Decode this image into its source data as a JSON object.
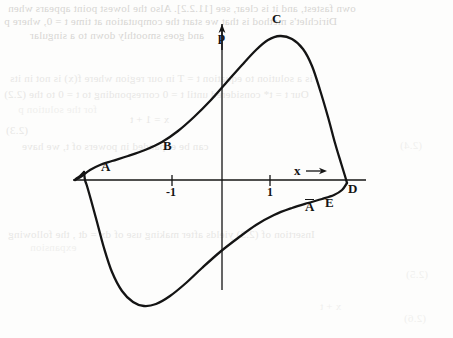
{
  "document": {
    "kind": "scanned-textbook-figure-page",
    "page_width": 453,
    "page_height": 338,
    "background_color": "#fdfdfc",
    "ink_color": "#141414",
    "bleed_color": "#b9b7b3"
  },
  "figure": {
    "caption": "",
    "axes": {
      "vertical": {
        "name": "p",
        "label": "p",
        "arrow": "up",
        "x_px": 222,
        "top_px": 22,
        "bottom_px": 290
      },
      "horizontal": {
        "name": "x",
        "label": "x",
        "arrow": "right",
        "arrow_label": "x→",
        "y_px": 180,
        "left_px": 73,
        "right_px": 366
      },
      "ticks": [
        {
          "label": "-1",
          "value": -1,
          "x_px": 172
        },
        {
          "label": "1",
          "value": 1,
          "x_px": 270
        }
      ],
      "unit_px": 49
    },
    "point_labels": [
      {
        "id": "A",
        "label": "A",
        "x_px": 101,
        "y_px": 160,
        "overbar": false
      },
      {
        "id": "B",
        "label": "B",
        "x_px": 163,
        "y_px": 139,
        "overbar": false
      },
      {
        "id": "C",
        "label": "C",
        "x_px": 272,
        "y_px": 12,
        "overbar": false
      },
      {
        "id": "D",
        "label": "D",
        "x_px": 348,
        "y_px": 182,
        "overbar": false
      },
      {
        "id": "E",
        "label": "E",
        "x_px": 325,
        "y_px": 196,
        "overbar": false
      },
      {
        "id": "Abar",
        "label": "A",
        "x_px": 305,
        "y_px": 199,
        "overbar": true
      }
    ]
  },
  "chart_data": {
    "type": "line",
    "title": "",
    "xlabel": "x",
    "ylabel": "p",
    "grid": false,
    "legend": "none",
    "xlim": [
      -3.05,
      2.95
    ],
    "ylim": [
      -2.55,
      3.25
    ],
    "xticks": [
      -1,
      1
    ],
    "yticks": [],
    "series": [
      {
        "name": "upper-branch",
        "comment": "Path running from the left turning point through A and B up to the maximum C and steeply down to D on the x-axis.",
        "points_px": [
          [
            75,
            180
          ],
          [
            82,
            176
          ],
          [
            90,
            170
          ],
          [
            100,
            165
          ],
          [
            112,
            161
          ],
          [
            128,
            156
          ],
          [
            145,
            150
          ],
          [
            162,
            142
          ],
          [
            178,
            131
          ],
          [
            194,
            117
          ],
          [
            210,
            101
          ],
          [
            226,
            83
          ],
          [
            242,
            65
          ],
          [
            256,
            50
          ],
          [
            268,
            40
          ],
          [
            280,
            36
          ],
          [
            292,
            39
          ],
          [
            303,
            49
          ],
          [
            312,
            66
          ],
          [
            320,
            90
          ],
          [
            328,
            117
          ],
          [
            335,
            143
          ],
          [
            341,
            163
          ],
          [
            345,
            176
          ],
          [
            347,
            183
          ]
        ]
      },
      {
        "name": "lower-branch",
        "comment": "Path continuing from D back leftwards below the axis through E and A-bar, down to the minimum and steeply up to close at the left turning point.",
        "points_px": [
          [
            347,
            183
          ],
          [
            342,
            190
          ],
          [
            334,
            195
          ],
          [
            322,
            199
          ],
          [
            308,
            203
          ],
          [
            292,
            208
          ],
          [
            274,
            215
          ],
          [
            256,
            225
          ],
          [
            238,
            238
          ],
          [
            220,
            252
          ],
          [
            202,
            268
          ],
          [
            186,
            283
          ],
          [
            170,
            296
          ],
          [
            156,
            304
          ],
          [
            144,
            306
          ],
          [
            133,
            302
          ],
          [
            122,
            291
          ],
          [
            112,
            272
          ],
          [
            104,
            248
          ],
          [
            97,
            222
          ],
          [
            91,
            200
          ],
          [
            87,
            186
          ],
          [
            85,
            180
          ],
          [
            84,
            172
          ]
        ]
      },
      {
        "name": "left-cusp",
        "comment": "Short steep left turning segment joining the two branches just left of the origin.",
        "points_px": [
          [
            84,
            172
          ],
          [
            80,
            176
          ],
          [
            76,
            179
          ],
          [
            75,
            180
          ]
        ]
      }
    ]
  },
  "bleed_text": {
    "note": "Faint mirrored show-through of printed text from the reverse side of the page.",
    "lines": [
      {
        "text": "own fastest, and it is clear, see [11.2.2].  Also the lowest point appears when",
        "x_px": 8,
        "y_px": 2,
        "size_px": 11,
        "class": "bleed"
      },
      {
        "text": "Dirichlet's method is that we start the computation at time t = 0, where p",
        "x_px": 4,
        "y_px": 15,
        "size_px": 11,
        "class": "bleed"
      },
      {
        "text": "and goes smoothly down to a singular",
        "x_px": 30,
        "y_px": 29,
        "size_px": 11,
        "class": "bleed"
      },
      {
        "text": "is a solution to equation   t = T   in our region where f(x) is not in its",
        "x_px": 10,
        "y_px": 72,
        "size_px": 11,
        "class": "bleed faint"
      },
      {
        "text": "Our  t = t* considered until   t = 0 corresponding to   t = 0 to the  (2.2)",
        "x_px": 4,
        "y_px": 88,
        "size_px": 11,
        "class": "bleed faint"
      },
      {
        "text": "for the solution p",
        "x_px": 18,
        "y_px": 103,
        "size_px": 11,
        "class": "bleed veryfaint"
      },
      {
        "text": "x = 1 + t",
        "x_px": 130,
        "y_px": 113,
        "size_px": 11,
        "class": "bleed faint"
      },
      {
        "text": "(2.3)",
        "x_px": 6,
        "y_px": 124,
        "size_px": 11,
        "class": "bleed faint"
      },
      {
        "text": "can be expanded in powers of  t, we have",
        "x_px": 22,
        "y_px": 140,
        "size_px": 11,
        "class": "bleed faint"
      },
      {
        "text": "(2.4)",
        "x_px": 400,
        "y_px": 139,
        "size_px": 11,
        "class": "bleed veryfaint"
      },
      {
        "text": "Insertion of (2.3) yields after making use of  dx = dt , the following",
        "x_px": 8,
        "y_px": 228,
        "size_px": 11,
        "class": "bleed faint"
      },
      {
        "text": "expansion",
        "x_px": 30,
        "y_px": 241,
        "size_px": 11,
        "class": "bleed veryfaint"
      },
      {
        "text": "(2.5)",
        "x_px": 406,
        "y_px": 268,
        "size_px": 11,
        "class": "bleed veryfaint"
      },
      {
        "text": "(2.6)",
        "x_px": 404,
        "y_px": 312,
        "size_px": 11,
        "class": "bleed veryfaint"
      },
      {
        "text": "x + t",
        "x_px": 320,
        "y_px": 300,
        "size_px": 11,
        "class": "bleed veryfaint"
      }
    ]
  }
}
